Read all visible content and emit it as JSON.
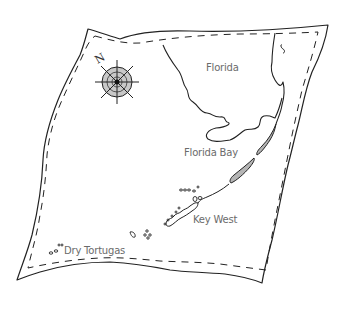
{
  "map": {
    "title": "Florida Keys sketch map",
    "labels": {
      "florida": "Florida",
      "florida_bay": "Florida Bay",
      "key_west": "Key West",
      "dry_tortugas": "Dry Tortugas"
    },
    "compass": {
      "north_label": "N"
    },
    "colors": {
      "ink": "#222222",
      "label_text": "#6b6b6b",
      "compass_fill": "#c8c8c8",
      "keys_fill": "#b5b5b5",
      "background": "#ffffff"
    }
  }
}
